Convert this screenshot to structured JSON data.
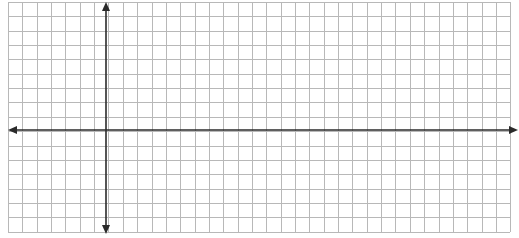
{
  "diagram": {
    "type": "coordinate-grid",
    "grid": {
      "x_start": 8,
      "y_start": 2,
      "spacing": 14.35,
      "columns": 35,
      "rows": 16,
      "line_color": "#b8b8b8"
    },
    "axes": {
      "color": "#2a2a2a",
      "x_axis": {
        "y": 130,
        "x_from": 8,
        "x_to": 518,
        "arrows": "both"
      },
      "y_axis": {
        "x": 106,
        "y_from": 2,
        "y_to": 234,
        "arrows": "both"
      }
    },
    "labels": []
  }
}
